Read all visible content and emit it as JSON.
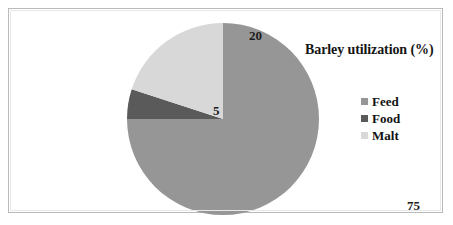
{
  "chart_data": {
    "type": "pie",
    "title": "Barley utilization (%)",
    "xlabel": "",
    "ylabel": "",
    "legend_position": "right",
    "grid": false,
    "categories": [
      "Feed",
      "Food",
      "Malt"
    ],
    "values": [
      75,
      5,
      20
    ],
    "value_labels": [
      "75",
      "5",
      "20"
    ],
    "colors": [
      "#969696",
      "#5a5a5a",
      "#d8d8d8"
    ],
    "slices": [
      {
        "label": "Feed",
        "value": 75,
        "value_label": "75",
        "color": "#969696",
        "start_angle": 0,
        "end_angle": 270
      },
      {
        "label": "Food",
        "value": 5,
        "value_label": "5",
        "color": "#5a5a5a",
        "start_angle": 270,
        "end_angle": 288
      },
      {
        "label": "Malt",
        "value": 20,
        "value_label": "20",
        "color": "#d8d8d8",
        "start_angle": 288,
        "end_angle": 360
      }
    ],
    "total": 100,
    "units": "%"
  },
  "legend": {
    "items": [
      {
        "label": "Feed",
        "color": "#969696"
      },
      {
        "label": "Food",
        "color": "#5a5a5a"
      },
      {
        "label": "Malt",
        "color": "#d8d8d8"
      }
    ]
  },
  "frame": {
    "border_color": "#b9b9b9",
    "background": "#ffffff"
  }
}
